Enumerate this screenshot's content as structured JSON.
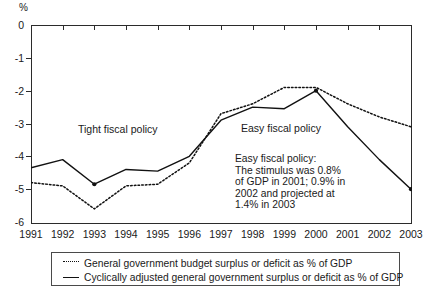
{
  "chart_data": {
    "type": "line",
    "title": "",
    "xlabel": "",
    "ylabel": "%",
    "unit_label": "%",
    "categories": [
      "1991",
      "1992",
      "1993",
      "1994",
      "1995",
      "1996",
      "1997",
      "1998",
      "1999",
      "2000",
      "2001",
      "2002",
      "2003"
    ],
    "x": [
      1991,
      1992,
      1993,
      1994,
      1995,
      1996,
      1997,
      1998,
      1999,
      2000,
      2001,
      2002,
      2003
    ],
    "xlim": [
      1991,
      2003
    ],
    "ylim": [
      -6,
      0
    ],
    "yticks": [
      0,
      -1,
      -2,
      -3,
      -4,
      -5,
      -6
    ],
    "ytick_labels": [
      "0",
      "-1",
      "-2",
      "-3",
      "-4",
      "-5",
      "-6"
    ],
    "grid": false,
    "legend_position": "below",
    "series": [
      {
        "name": "General government budget surplus or deficit as % of GDP",
        "style": "dotted",
        "values": [
          -4.8,
          -4.9,
          -5.6,
          -4.9,
          -4.85,
          -4.2,
          -2.7,
          -2.4,
          -1.9,
          -1.9,
          -2.4,
          -2.8,
          -3.1
        ]
      },
      {
        "name": "Cyclically adjusted general government surplus or deficit as % of GDP",
        "style": "solid",
        "values": [
          -4.35,
          -4.1,
          -4.85,
          -4.4,
          -4.45,
          -4.0,
          -2.9,
          -2.5,
          -2.55,
          -2.0,
          -3.1,
          -4.1,
          -5.0
        ]
      }
    ],
    "annotations": [
      {
        "name": "tight-fiscal-policy",
        "text": "Tight fiscal policy"
      },
      {
        "name": "easy-fiscal-policy",
        "text": "Easy fiscal policy"
      }
    ],
    "note": {
      "lines": [
        "Easy fiscal policy:",
        "The stimulus was 0.8%",
        "of GDP in 2001; 0.9% in",
        "2002 and projected at",
        "1.4% in 2003"
      ]
    },
    "colors": {
      "axis": "#2b2b2b",
      "series_dotted": "#111111",
      "series_solid": "#111111",
      "background": "#ffffff",
      "text": "#1a1a1a"
    }
  },
  "legend": {
    "items": [
      {
        "key": "dotted",
        "label": "General government budget surplus or deficit as % of GDP"
      },
      {
        "key": "solid",
        "label": "Cyclically adjusted general government surplus or deficit as % of GDP"
      }
    ]
  }
}
